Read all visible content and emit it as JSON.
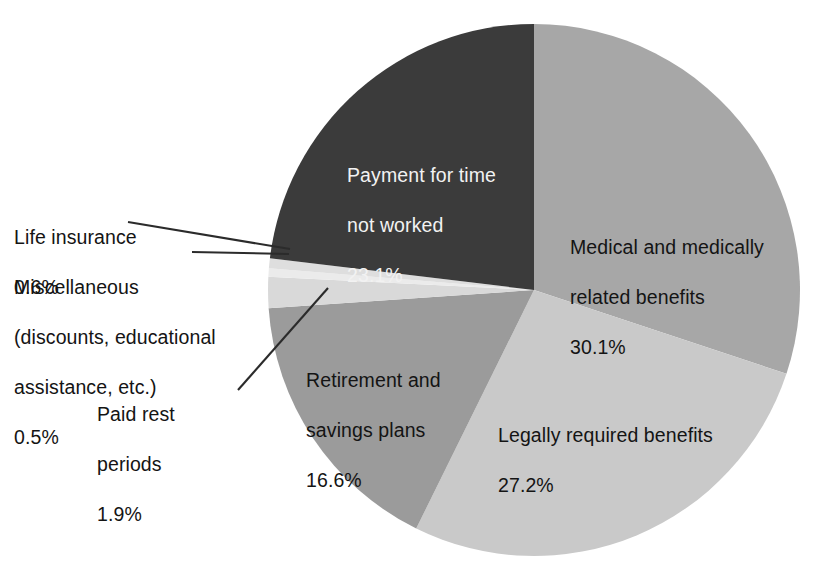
{
  "chart_data": {
    "type": "pie",
    "title": "",
    "subtitle": "",
    "xlabel": "",
    "ylabel": "",
    "legend_position": "none",
    "grid": false,
    "units": "percent",
    "start_angle_deg": 0,
    "direction": "clockwise",
    "total": 100.0,
    "categories": [
      "Medical and medically related benefits",
      "Legally required benefits",
      "Retirement and savings plans",
      "Paid rest periods",
      "Miscellaneous (discounts, educational assistance, etc.)",
      "Life insurance",
      "Payment for time not worked"
    ],
    "values": [
      30.1,
      27.2,
      16.6,
      1.9,
      0.5,
      0.6,
      23.1
    ],
    "colors": [
      "#a7a7a7",
      "#c9c9c9",
      "#9b9b9b",
      "#d9d9d9",
      "#ebebeb",
      "#dedede",
      "#3b3b3b"
    ],
    "slices": [
      {
        "label": "Medical and medically related benefits",
        "value": 30.1,
        "value_text": "30.1%",
        "color": "#a7a7a7"
      },
      {
        "label": "Legally required benefits",
        "value": 27.2,
        "value_text": "27.2%",
        "color": "#c9c9c9"
      },
      {
        "label": "Retirement and savings plans",
        "value": 16.6,
        "value_text": "16.6%",
        "color": "#9b9b9b"
      },
      {
        "label": "Paid rest periods",
        "value": 1.9,
        "value_text": "1.9%",
        "color": "#d9d9d9"
      },
      {
        "label": "Miscellaneous (discounts, educational assistance, etc.)",
        "value": 0.5,
        "value_text": "0.5%",
        "color": "#ebebeb"
      },
      {
        "label": "Life insurance",
        "value": 0.6,
        "value_text": "0.6%",
        "color": "#dedede"
      },
      {
        "label": "Payment for time not worked",
        "value": 23.1,
        "value_text": "23.1%",
        "color": "#3b3b3b"
      }
    ]
  },
  "labels": {
    "payment": {
      "line1": "Payment for time",
      "line2": "not worked",
      "pct": "23.1%"
    },
    "medical": {
      "line1": "Medical and medically",
      "line2": "related benefits",
      "pct": "30.1%"
    },
    "legally": {
      "line1": "Legally required benefits",
      "pct": "27.2%"
    },
    "retirement": {
      "line1": "Retirement and",
      "line2": "savings plans",
      "pct": "16.6%"
    },
    "life_insurance": {
      "line1": "Life insurance",
      "pct": "0.6%"
    },
    "miscellaneous": {
      "line1": "Miscellaneous",
      "line2": "(discounts, educational",
      "line3": "assistance, etc.)",
      "pct": "0.5%"
    },
    "paid_rest": {
      "line1": "Paid rest",
      "line2": "periods",
      "pct": "1.9%"
    }
  },
  "style": {
    "background": "#ffffff",
    "leader_line_color": "#2b2b2b",
    "text_color": "#141414",
    "inside_dark_text_color": "#f2f2f2"
  }
}
